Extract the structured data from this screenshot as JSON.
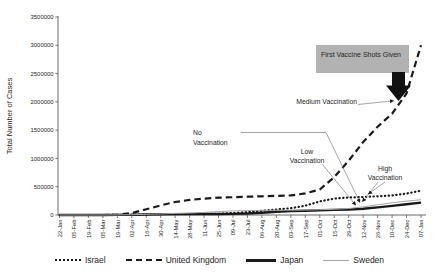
{
  "chart_data": {
    "type": "line",
    "title": "",
    "xlabel": "",
    "ylabel": "Total Number of Cases",
    "ylim": [
      0,
      3500000
    ],
    "grid": false,
    "legend_position": "bottom",
    "ytick_labels": [
      "0",
      "500000",
      "1000000",
      "1500000",
      "2000000",
      "2500000",
      "3000000",
      "3500000"
    ],
    "yticks": [
      0,
      500000,
      1000000,
      1500000,
      2000000,
      2500000,
      3000000,
      3500000
    ],
    "categories": [
      "22-Jan",
      "05-Feb",
      "19-Feb",
      "05-Mar",
      "19-Mar",
      "02-Apr",
      "16-Apr",
      "30-Apr",
      "14-May",
      "28-May",
      "11-Jun",
      "25-Jun",
      "09-Jul",
      "23-Jul",
      "06-Aug",
      "20-Aug",
      "03-Sep",
      "17-Sep",
      "01-Oct",
      "15-Oct",
      "29-Oct",
      "12-Nov",
      "26-Nov",
      "10-Dec",
      "24-Dec",
      "07-Jan"
    ],
    "series": [
      {
        "name": "Israel",
        "style": "dotted",
        "color": "#1a1a1a",
        "width": 2.2,
        "values": [
          0,
          0,
          0,
          0,
          1000,
          6000,
          12000,
          16000,
          16500,
          17000,
          18000,
          22000,
          33000,
          52000,
          75000,
          97000,
          120000,
          165000,
          240000,
          290000,
          310000,
          318000,
          330000,
          345000,
          380000,
          430000
        ]
      },
      {
        "name": "United Kingdom",
        "style": "dashed",
        "color": "#1a1a1a",
        "width": 2.2,
        "values": [
          0,
          0,
          0,
          100,
          3000,
          34000,
          100000,
          170000,
          230000,
          267000,
          290000,
          305000,
          315000,
          323000,
          330000,
          338000,
          347000,
          382000,
          450000,
          670000,
          960000,
          1290000,
          1560000,
          1790000,
          2150000,
          3000000
        ]
      },
      {
        "name": "Japan",
        "style": "solid",
        "color": "#1a1a1a",
        "width": 2.4,
        "values": [
          0,
          0,
          0,
          300,
          1000,
          2500,
          8500,
          14000,
          16000,
          16500,
          17200,
          18000,
          20000,
          27000,
          40000,
          58000,
          69000,
          76000,
          83000,
          90000,
          97000,
          112000,
          135000,
          160000,
          190000,
          220000
        ]
      },
      {
        "name": "Sweden",
        "style": "solid",
        "color": "#a6a6a6",
        "width": 1,
        "values": [
          0,
          0,
          0,
          200,
          1400,
          5000,
          12000,
          20000,
          28000,
          35000,
          46000,
          60000,
          72000,
          77000,
          81000,
          84000,
          85000,
          88000,
          93000,
          100000,
          115000,
          145000,
          180000,
          215000,
          245000,
          270000
        ]
      }
    ],
    "annotations": {
      "box_label": "First Vaccine Shots Given",
      "medium": "Medium Vaccination",
      "no": {
        "lines": [
          "No",
          "Vaccination"
        ]
      },
      "low": {
        "lines": [
          "Low",
          "Vaccination"
        ]
      },
      "high": {
        "lines": [
          "High",
          "Vaccination"
        ]
      }
    }
  },
  "colors": {
    "annotation_box": "#b2b2b2",
    "block_arrow": "#111111",
    "axis": "#595959",
    "leader_line": "#7f7f7f",
    "text": "#262626"
  }
}
